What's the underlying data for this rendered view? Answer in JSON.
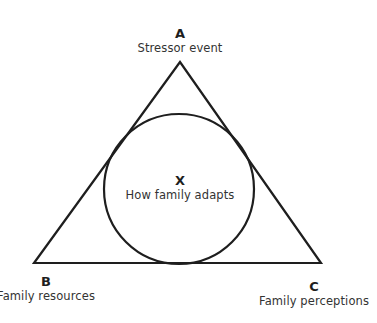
{
  "diagram": {
    "nodes": {
      "A": {
        "letter": "A",
        "caption": "Stressor event"
      },
      "B": {
        "letter": "B",
        "caption": "Family resources"
      },
      "C": {
        "letter": "C",
        "caption": "Family perceptions"
      },
      "X": {
        "letter": "X",
        "caption": "How family adapts"
      }
    },
    "shapes": {
      "triangle": {
        "points": [
          [
            180,
            62
          ],
          [
            34,
            263
          ],
          [
            321,
            263
          ]
        ],
        "stroke": "#1e1e1e"
      },
      "circle": {
        "cx": 179,
        "cy": 189,
        "r": 75,
        "stroke": "#1e1e1e"
      }
    }
  }
}
